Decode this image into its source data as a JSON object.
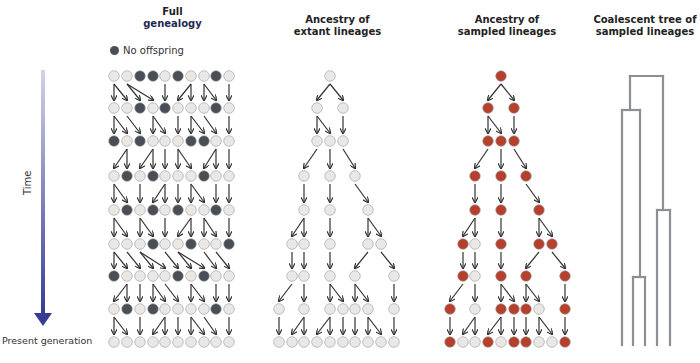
{
  "panels": {
    "full": {
      "title_line1": "Full",
      "title_line2": "genealogy"
    },
    "extant": {
      "title_line1": "Ancestry of",
      "title_line2": "extant lineages"
    },
    "sampled": {
      "title_line1": "Ancestry of",
      "title_line2": "sampled lineages"
    },
    "tree": {
      "title_line1": "Coalescent tree of",
      "title_line2": "sampled lineages"
    }
  },
  "legend": {
    "no_offspring": "No offspring"
  },
  "axis": {
    "time_label": "Time",
    "present_label": "Present generation"
  },
  "colors": {
    "light_circle": "#e9e8e6",
    "dark_circle": "#4a4f55",
    "sampled_circle": "#b5412c",
    "arrow": "#333333",
    "tree_line": "#8a9096",
    "time_arrow_top": "#c9c9e6",
    "time_arrow_bottom": "#3a3f96"
  },
  "grid": {
    "rows_y": [
      76,
      108,
      141,
      176,
      210,
      244,
      276,
      309,
      342
    ],
    "full_x": [
      114,
      127,
      140,
      153,
      165,
      178,
      191,
      204,
      216,
      229
    ],
    "extant_x": [
      279,
      292,
      304,
      317,
      330,
      343,
      355,
      368,
      381,
      394
    ],
    "sampled_x": [
      450,
      462,
      475,
      488,
      501,
      514,
      526,
      539,
      552,
      565
    ],
    "full_dark": [
      "0011010010",
      "0010100010",
      "1010001100",
      "0101000100",
      "0101010010",
      "0001001001",
      "1000010100",
      "0101000010",
      "0000000000"
    ]
  },
  "extant_tree": {
    "nodes": [
      {
        "r": 0,
        "x": 330
      },
      {
        "r": 1,
        "x": 317
      },
      {
        "r": 1,
        "x": 343
      },
      {
        "r": 2,
        "x": 317
      },
      {
        "r": 2,
        "x": 330
      },
      {
        "r": 2,
        "x": 343
      },
      {
        "r": 3,
        "x": 304
      },
      {
        "r": 3,
        "x": 330
      },
      {
        "r": 3,
        "x": 355
      },
      {
        "r": 4,
        "x": 304
      },
      {
        "r": 4,
        "x": 330
      },
      {
        "r": 4,
        "x": 368
      },
      {
        "r": 5,
        "x": 292
      },
      {
        "r": 5,
        "x": 304
      },
      {
        "r": 5,
        "x": 330
      },
      {
        "r": 5,
        "x": 368
      },
      {
        "r": 5,
        "x": 381
      },
      {
        "r": 6,
        "x": 292
      },
      {
        "r": 6,
        "x": 304
      },
      {
        "r": 6,
        "x": 330
      },
      {
        "r": 6,
        "x": 355
      },
      {
        "r": 6,
        "x": 394
      },
      {
        "r": 7,
        "x": 279
      },
      {
        "r": 7,
        "x": 304
      },
      {
        "r": 7,
        "x": 330
      },
      {
        "r": 7,
        "x": 343
      },
      {
        "r": 7,
        "x": 355
      },
      {
        "r": 7,
        "x": 368
      },
      {
        "r": 7,
        "x": 394
      },
      {
        "r": 8,
        "x": 279
      },
      {
        "r": 8,
        "x": 292
      },
      {
        "r": 8,
        "x": 304
      },
      {
        "r": 8,
        "x": 317
      },
      {
        "r": 8,
        "x": 330
      },
      {
        "r": 8,
        "x": 343
      },
      {
        "r": 8,
        "x": 355
      },
      {
        "r": 8,
        "x": 368
      },
      {
        "r": 8,
        "x": 381
      },
      {
        "r": 8,
        "x": 394
      }
    ],
    "edges": [
      [
        0,
        330,
        317
      ],
      [
        0,
        330,
        343
      ],
      [
        1,
        317,
        317
      ],
      [
        1,
        317,
        330
      ],
      [
        1,
        343,
        343
      ],
      [
        2,
        317,
        304
      ],
      [
        2,
        330,
        330
      ],
      [
        2,
        343,
        355
      ],
      [
        3,
        304,
        304
      ],
      [
        3,
        330,
        330
      ],
      [
        3,
        355,
        368
      ],
      [
        4,
        304,
        292
      ],
      [
        4,
        304,
        304
      ],
      [
        4,
        330,
        330
      ],
      [
        4,
        368,
        368
      ],
      [
        4,
        368,
        381
      ],
      [
        5,
        292,
        292
      ],
      [
        5,
        304,
        304
      ],
      [
        5,
        330,
        330
      ],
      [
        5,
        368,
        355
      ],
      [
        5,
        381,
        394
      ],
      [
        6,
        292,
        279
      ],
      [
        6,
        304,
        304
      ],
      [
        6,
        330,
        330
      ],
      [
        6,
        330,
        343
      ],
      [
        6,
        355,
        355
      ],
      [
        6,
        355,
        368
      ],
      [
        6,
        394,
        394
      ],
      [
        7,
        279,
        279
      ],
      [
        7,
        304,
        292
      ],
      [
        7,
        304,
        304
      ],
      [
        7,
        330,
        317
      ],
      [
        7,
        330,
        330
      ],
      [
        7,
        343,
        343
      ],
      [
        7,
        355,
        355
      ],
      [
        7,
        368,
        368
      ],
      [
        7,
        368,
        381
      ],
      [
        7,
        394,
        394
      ]
    ]
  },
  "sampled_red": {
    "r0": [
      330
    ],
    "r1": [
      317,
      343
    ],
    "r2": [
      317,
      330,
      343
    ],
    "r3": [
      304,
      330,
      355
    ],
    "r4": [
      304,
      330,
      368
    ],
    "r5": [
      292,
      330,
      368,
      381
    ],
    "r6": [
      292,
      330,
      355,
      394
    ],
    "r7": [
      279,
      330,
      343,
      355,
      394
    ],
    "r8": [
      279,
      317,
      343,
      355,
      394
    ]
  },
  "coalescent_tree": {
    "segments": [
      [
        630,
        76,
        663,
        76
      ],
      [
        630,
        76,
        630,
        110
      ],
      [
        663,
        76,
        663,
        210
      ],
      [
        622,
        110,
        640,
        110
      ],
      [
        622,
        110,
        622,
        345
      ],
      [
        640,
        110,
        640,
        277
      ],
      [
        657,
        210,
        670,
        210
      ],
      [
        657,
        210,
        657,
        345
      ],
      [
        670,
        210,
        670,
        345
      ],
      [
        633,
        277,
        645,
        277
      ],
      [
        633,
        277,
        633,
        345
      ],
      [
        645,
        277,
        645,
        345
      ]
    ]
  }
}
